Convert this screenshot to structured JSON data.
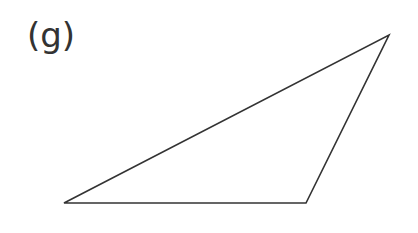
{
  "diagram": {
    "label": "(g)",
    "shape": "triangle",
    "vertices": [
      [
        64,
        203
      ],
      [
        306,
        203
      ],
      [
        389,
        35
      ]
    ],
    "stroke_color": "#333333",
    "stroke_width": 1.6
  }
}
